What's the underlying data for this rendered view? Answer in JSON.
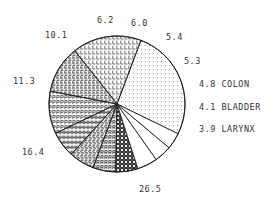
{
  "chart_data": {
    "type": "pie",
    "title": "",
    "center": [
      117,
      104
    ],
    "radius": 68,
    "start_angle_deg": 26,
    "direction": "counterclockwise",
    "slices": [
      {
        "value": 26.5,
        "label": "26.5",
        "name": "",
        "pattern": "dots"
      },
      {
        "value": 16.4,
        "label": "16.4",
        "name": "",
        "pattern": "letter-L"
      },
      {
        "value": 11.3,
        "label": "11.3",
        "name": "",
        "pattern": "letter-E"
      },
      {
        "value": 10.1,
        "label": "10.1",
        "name": "",
        "pattern": "letter-P"
      },
      {
        "value": 6.2,
        "label": "6.2",
        "name": "",
        "pattern": "letter-H"
      },
      {
        "value": 6.0,
        "label": "6.0",
        "name": "",
        "pattern": "letter-S"
      },
      {
        "value": 5.4,
        "label": "5.4",
        "name": "",
        "pattern": "letter-R"
      },
      {
        "value": 5.3,
        "label": "5.3",
        "name": "",
        "pattern": "dense-grid"
      },
      {
        "value": 4.8,
        "label": "4.8",
        "name": "COLON",
        "pattern": "none"
      },
      {
        "value": 4.1,
        "label": "4.1",
        "name": "BLADDER",
        "pattern": "none"
      },
      {
        "value": 3.9,
        "label": "3.9",
        "name": "LARYNX",
        "pattern": "none"
      }
    ],
    "categories": [
      "26.5",
      "16.4",
      "11.3",
      "10.1",
      "6.2",
      "6.0",
      "5.4",
      "5.3",
      "COLON",
      "BLADDER",
      "LARYNX"
    ],
    "values": [
      26.5,
      16.4,
      11.3,
      10.1,
      6.2,
      6.0,
      5.4,
      5.3,
      4.8,
      4.1,
      3.9
    ],
    "legend": "none (labels placed outside slices)",
    "colors": {
      "stroke": "#222222",
      "text": "#333333",
      "background": "#ffffff"
    }
  },
  "labels": [
    {
      "text": "26.5",
      "x": 139,
      "y": 192
    },
    {
      "text": "16.4",
      "x": 22,
      "y": 155
    },
    {
      "text": "11.3",
      "x": 13,
      "y": 84
    },
    {
      "text": "10.1",
      "x": 45,
      "y": 38
    },
    {
      "text": "6.2",
      "x": 97,
      "y": 23
    },
    {
      "text": "6.0",
      "x": 131,
      "y": 26
    },
    {
      "text": "5.4",
      "x": 166,
      "y": 40
    },
    {
      "text": "5.3",
      "x": 184,
      "y": 64
    },
    {
      "text": "4.8 COLON",
      "x": 199,
      "y": 87
    },
    {
      "text": "4.1 BLADDER",
      "x": 199,
      "y": 110
    },
    {
      "text": "3.9 LARYNX",
      "x": 199,
      "y": 132
    }
  ]
}
